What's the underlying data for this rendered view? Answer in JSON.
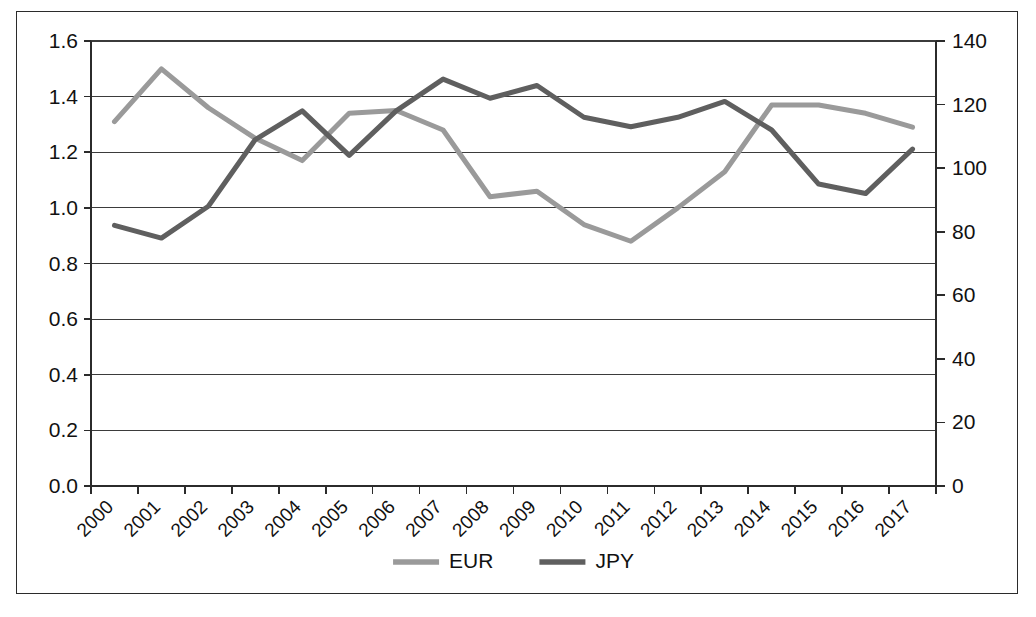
{
  "chart_data": {
    "type": "line",
    "title": "",
    "subtitle": "",
    "xlabel": "",
    "ylabel": "",
    "y2label": "",
    "grid": true,
    "legend_position": "bottom",
    "categories": [
      "2000",
      "2001",
      "2002",
      "2003",
      "2004",
      "2005",
      "2006",
      "2007",
      "2008",
      "2009",
      "2010",
      "2011",
      "2012",
      "2013",
      "2014",
      "2015",
      "2016",
      "2017"
    ],
    "x_tick_rotation": 45,
    "axes": {
      "left": {
        "min": 0.0,
        "max": 1.6,
        "step": 0.2,
        "ticks": [
          "0.0",
          "0.2",
          "0.4",
          "0.6",
          "0.8",
          "1.0",
          "1.2",
          "1.4",
          "1.6"
        ]
      },
      "right": {
        "min": 0,
        "max": 140,
        "step": 20,
        "ticks": [
          "0",
          "20",
          "40",
          "60",
          "80",
          "100",
          "120",
          "140"
        ]
      }
    },
    "series": [
      {
        "name": "EUR",
        "axis": "left",
        "color": "#9a9a9a",
        "stroke_width": 5.0,
        "values": [
          1.31,
          1.5,
          1.36,
          1.25,
          1.17,
          1.34,
          1.35,
          1.28,
          1.04,
          1.06,
          0.94,
          0.88,
          1.0,
          1.13,
          1.37,
          1.37,
          1.34,
          1.29
        ]
      },
      {
        "name": "JPY",
        "axis": "right",
        "color": "#5f5f5f",
        "stroke_width": 5.0,
        "values": [
          82,
          78,
          88,
          109,
          118,
          104,
          118,
          128,
          122,
          126,
          116,
          113,
          116,
          121,
          112,
          95,
          92,
          106
        ]
      }
    ],
    "legend": [
      {
        "label": "EUR",
        "color": "#9a9a9a"
      },
      {
        "label": "JPY",
        "color": "#5f5f5f"
      }
    ]
  }
}
